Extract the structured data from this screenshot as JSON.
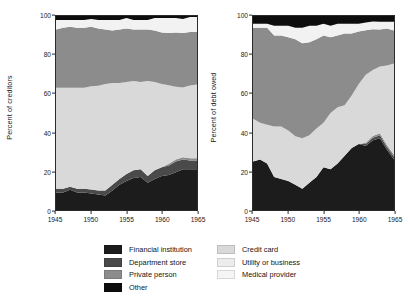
{
  "chart_data": [
    {
      "type": "area",
      "id": "creditors",
      "title": "",
      "xlabel": "",
      "ylabel": "Percent of creditors",
      "stacked": true,
      "percent": true,
      "grid": false,
      "legend_position": "bottom",
      "xlim": [
        1945,
        1965
      ],
      "ylim": [
        0,
        100
      ],
      "xticks": [
        1945,
        1950,
        1955,
        1960,
        1965
      ],
      "yticks": [
        0,
        20,
        40,
        60,
        80,
        100
      ],
      "x": [
        1945,
        1946,
        1947,
        1948,
        1949,
        1950,
        1951,
        1952,
        1953,
        1954,
        1955,
        1956,
        1957,
        1958,
        1959,
        1960,
        1961,
        1962,
        1963,
        1964,
        1965
      ],
      "series": [
        {
          "name": "Financial institution",
          "color": "#1c1c1c",
          "values": [
            9,
            9,
            10.5,
            9,
            9,
            8.5,
            8,
            7.5,
            10,
            13,
            15,
            16.5,
            17,
            14,
            16,
            17.5,
            18,
            19.5,
            21,
            21,
            21
          ]
        },
        {
          "name": "Department store",
          "color": "#4a4a4a",
          "values": [
            2,
            2,
            1.5,
            2,
            2,
            2,
            2,
            2.5,
            3,
            3,
            3.5,
            4,
            4,
            3.5,
            4.5,
            4.5,
            5,
            5.5,
            5,
            4.5,
            4.5
          ]
        },
        {
          "name": "Private person",
          "color": "#8c8c8c",
          "values": [
            0,
            0,
            0,
            0,
            0,
            0,
            0,
            0,
            0,
            0,
            0,
            0,
            0,
            0,
            0,
            0,
            0.8,
            1,
            1.2,
            1.2,
            1.2
          ]
        },
        {
          "name": "Credit card",
          "color": "#d9d9d9",
          "values": [
            52,
            52,
            51,
            52,
            52,
            53,
            54,
            55,
            52.5,
            49.5,
            47.5,
            46,
            45,
            49,
            45.5,
            43,
            40.5,
            37.5,
            36,
            37.5,
            38
          ]
        },
        {
          "name": "Utility or business",
          "color": "#8c8c8c",
          "values": [
            30,
            31,
            31.5,
            31,
            31,
            30.5,
            29.5,
            28,
            27,
            27.5,
            27.5,
            26.5,
            27,
            26.5,
            26.5,
            26.5,
            27,
            28,
            28,
            27.5,
            27
          ]
        },
        {
          "name": "Medical provider",
          "color": "#f2f2f2",
          "values": [
            5,
            4,
            3.5,
            4,
            4,
            4,
            4.5,
            5,
            5.5,
            5,
            5.5,
            5,
            5,
            5,
            6.5,
            7.5,
            7.7,
            7.5,
            7.3,
            7.8,
            7.8
          ]
        },
        {
          "name": "Other",
          "color": "#0d0d0d",
          "values": [
            2,
            2,
            2,
            2,
            2,
            1.5,
            2,
            2,
            2,
            2,
            1,
            2,
            2,
            2,
            1,
            1,
            1,
            1,
            1.5,
            0.5,
            0.5
          ]
        }
      ]
    },
    {
      "type": "area",
      "id": "debt",
      "title": "",
      "xlabel": "",
      "ylabel": "Percent of debt owed",
      "stacked": true,
      "percent": true,
      "grid": false,
      "legend_position": "bottom",
      "xlim": [
        1945,
        1965
      ],
      "ylim": [
        0,
        100
      ],
      "xticks": [
        1945,
        1950,
        1955,
        1960,
        1965
      ],
      "yticks": [
        0,
        20,
        40,
        60,
        80,
        100
      ],
      "x": [
        1945,
        1946,
        1947,
        1948,
        1949,
        1950,
        1951,
        1952,
        1953,
        1954,
        1955,
        1956,
        1957,
        1958,
        1959,
        1960,
        1961,
        1962,
        1963,
        1964,
        1965
      ],
      "series": [
        {
          "name": "Financial institution",
          "color": "#1c1c1c",
          "values": [
            25,
            26,
            24,
            17,
            16,
            15,
            13,
            11,
            14,
            17,
            22,
            21,
            24,
            28,
            32,
            34,
            33,
            36,
            37,
            31,
            26
          ]
        },
        {
          "name": "Department store",
          "color": "#4a4a4a",
          "values": [
            0,
            0,
            0,
            0,
            0,
            0,
            0,
            0,
            0,
            0,
            0,
            0,
            0,
            0,
            0,
            0,
            1,
            1.3,
            1.5,
            1.5,
            1.5
          ]
        },
        {
          "name": "Private person",
          "color": "#8c8c8c",
          "values": [
            0,
            0,
            0,
            0,
            0,
            0,
            0,
            0,
            0,
            0,
            0,
            0,
            0,
            0,
            0,
            0,
            0.7,
            0.9,
            1,
            1,
            1
          ]
        },
        {
          "name": "Credit card",
          "color": "#d9d9d9",
          "values": [
            22,
            19,
            20,
            26,
            27,
            26,
            25,
            26,
            24.5,
            25,
            23,
            29,
            29,
            26,
            27,
            31,
            35,
            34,
            34.5,
            41,
            47
          ]
        },
        {
          "name": "Utility or business",
          "color": "#8c8c8c",
          "values": [
            47,
            49,
            50,
            47,
            47,
            48,
            50,
            49,
            48,
            46,
            45,
            39,
            37,
            37,
            32,
            27,
            23,
            21,
            19,
            19,
            17
          ]
        },
        {
          "name": "Medical provider",
          "color": "#f2f2f2",
          "values": [
            2,
            2,
            2,
            5,
            5,
            6,
            6,
            8,
            8.5,
            7,
            6,
            6,
            6,
            5,
            5,
            4,
            4,
            4,
            4,
            3.5,
            4.5
          ]
        },
        {
          "name": "Other",
          "color": "#0d0d0d",
          "values": [
            4,
            4,
            4,
            5,
            5,
            5,
            6,
            6,
            5,
            5,
            4,
            5,
            4,
            4,
            4,
            4,
            3.3,
            2.8,
            3,
            3,
            3
          ]
        }
      ]
    }
  ],
  "panels": {
    "left": {
      "ylabel": "Percent of creditors"
    },
    "right": {
      "ylabel": "Percent of debt owed"
    }
  },
  "legend": {
    "column_a": [
      {
        "label": "Financial institution",
        "color": "#1c1c1c"
      },
      {
        "label": "Department store",
        "color": "#4a4a4a"
      },
      {
        "label": "Private person",
        "color": "#8c8c8c"
      },
      {
        "label": "Other",
        "color": "#0d0d0d"
      }
    ],
    "column_b": [
      {
        "label": "Credit card",
        "color": "#d9d9d9"
      },
      {
        "label": "Utility or business",
        "color": "#ececec"
      },
      {
        "label": "Medical provider",
        "color": "#f5f5f5"
      }
    ]
  }
}
